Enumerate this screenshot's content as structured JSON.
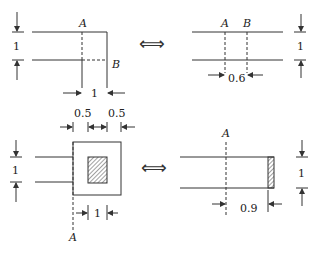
{
  "figure": {
    "colors": {
      "stroke": "#333333",
      "background": "#ffffff"
    },
    "equivalence_symbol": "⟺",
    "panels": {
      "top_left": {
        "point_a": "A",
        "point_b": "B",
        "height_dim": "1",
        "width_dim": "1"
      },
      "top_right": {
        "point_a": "A",
        "point_b": "B",
        "height_dim": "1",
        "width_dim": "0.6"
      },
      "bottom_left": {
        "point_a": "A",
        "height_dim": "1",
        "left_margin_dim": "0.5",
        "right_margin_dim": "0.5",
        "width_dim": "1"
      },
      "bottom_right": {
        "point_a": "A",
        "height_dim": "1",
        "width_dim": "0.9"
      }
    }
  }
}
